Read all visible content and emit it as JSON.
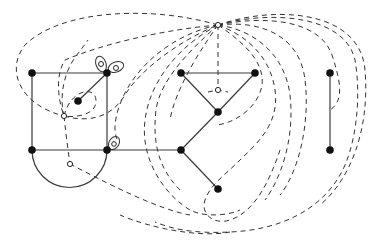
{
  "diagram": {
    "title": "",
    "colors": {
      "edge": "#3a3a3a",
      "vertex": "#111111",
      "dashed": "#333333",
      "background": "#ffffff"
    },
    "vertices": [
      {
        "id": "A",
        "x": 32,
        "y": 73,
        "type": "filled"
      },
      {
        "id": "B",
        "x": 107,
        "y": 73,
        "type": "filled"
      },
      {
        "id": "C",
        "x": 32,
        "y": 150,
        "type": "filled"
      },
      {
        "id": "D",
        "x": 107,
        "y": 150,
        "type": "filled"
      },
      {
        "id": "E",
        "x": 78,
        "y": 101,
        "type": "filled"
      },
      {
        "id": "F",
        "x": 181,
        "y": 73,
        "type": "filled"
      },
      {
        "id": "G",
        "x": 255,
        "y": 73,
        "type": "filled"
      },
      {
        "id": "H",
        "x": 218,
        "y": 112,
        "type": "filled"
      },
      {
        "id": "I",
        "x": 181,
        "y": 150,
        "type": "filled"
      },
      {
        "id": "J",
        "x": 218,
        "y": 189,
        "type": "filled"
      },
      {
        "id": "K",
        "x": 330,
        "y": 73,
        "type": "filled"
      },
      {
        "id": "L",
        "x": 330,
        "y": 150,
        "type": "filled"
      },
      {
        "id": "o1",
        "x": 218,
        "y": 25,
        "type": "hollow"
      },
      {
        "id": "o2",
        "x": 64,
        "y": 116,
        "type": "hollow"
      },
      {
        "id": "o3",
        "x": 70,
        "y": 164,
        "type": "hollow"
      },
      {
        "id": "o4",
        "x": 218,
        "y": 90,
        "type": "hollow"
      }
    ],
    "edges": [
      [
        "A",
        "B"
      ],
      [
        "A",
        "C"
      ],
      [
        "B",
        "D"
      ],
      [
        "C",
        "D"
      ],
      [
        "B",
        "E"
      ],
      [
        "D",
        "I"
      ],
      [
        "F",
        "G"
      ],
      [
        "F",
        "H"
      ],
      [
        "G",
        "H"
      ],
      [
        "H",
        "I"
      ],
      [
        "I",
        "J"
      ],
      [
        "K",
        "L"
      ]
    ],
    "arc_edges": [
      {
        "from": "C",
        "to": "D",
        "description": "semicircle below C-D"
      }
    ],
    "labels": []
  }
}
